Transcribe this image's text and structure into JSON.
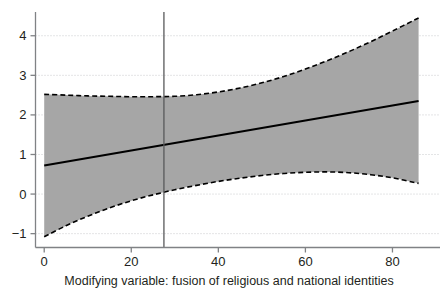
{
  "chart_data": {
    "type": "line",
    "title": "",
    "subtitle": "",
    "xlabel": "Modifying variable: fusion of religious and national identities",
    "ylabel": "",
    "xlim": [
      -2,
      90
    ],
    "ylim": [
      -1.35,
      4.6
    ],
    "xticks": [
      0,
      20,
      40,
      60,
      80
    ],
    "xtick_labels": [
      "0",
      "20",
      "40",
      "60",
      "80"
    ],
    "yticks": [
      -1,
      0,
      1,
      2,
      3,
      4
    ],
    "ytick_labels": [
      "−1",
      "0",
      "1",
      "2",
      "3",
      "4"
    ],
    "grid": "horizontal-dotted",
    "legend": "none",
    "x_data_range": [
      0,
      86
    ],
    "series": [
      {
        "name": "Marginal effect (fitted line)",
        "style": "solid",
        "color": "#000000",
        "x": [
          0,
          10,
          20,
          30,
          40,
          50,
          60,
          70,
          80,
          86
        ],
        "values": [
          0.72,
          0.91,
          1.1,
          1.29,
          1.48,
          1.67,
          1.86,
          2.05,
          2.24,
          2.35
        ]
      },
      {
        "name": "Upper 95% confidence bound",
        "style": "dashed",
        "color": "#000000",
        "x": [
          0,
          5,
          10,
          15,
          20,
          25,
          30,
          35,
          40,
          45,
          50,
          55,
          60,
          65,
          70,
          75,
          80,
          86
        ],
        "values": [
          2.52,
          2.5,
          2.48,
          2.47,
          2.46,
          2.46,
          2.47,
          2.51,
          2.58,
          2.68,
          2.81,
          2.97,
          3.16,
          3.37,
          3.6,
          3.85,
          4.12,
          4.45
        ]
      },
      {
        "name": "Lower 95% confidence bound",
        "style": "dashed",
        "color": "#000000",
        "x": [
          0,
          5,
          10,
          15,
          20,
          25,
          30,
          35,
          40,
          45,
          50,
          55,
          60,
          65,
          70,
          75,
          80,
          86
        ],
        "values": [
          -1.08,
          -0.8,
          -0.56,
          -0.35,
          -0.17,
          -0.02,
          0.11,
          0.22,
          0.32,
          0.4,
          0.47,
          0.52,
          0.55,
          0.56,
          0.54,
          0.49,
          0.41,
          0.27
        ]
      }
    ],
    "band": {
      "name": "95% confidence interval",
      "fill_color": "#a6a6a6",
      "upper_series": "Upper 95% confidence bound",
      "lower_series": "Lower 95% confidence bound"
    },
    "annotations": [
      {
        "name": "vertical-reference-line",
        "type": "vline",
        "x": 27.5,
        "color": "#58595b",
        "style": "solid"
      }
    ],
    "axis_color": "#808285",
    "grid_color": "#c9cacc"
  }
}
